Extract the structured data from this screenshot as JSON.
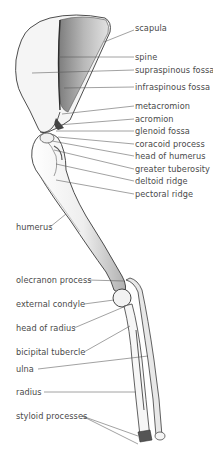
{
  "figure": {
    "colors": {
      "background": "#ffffff",
      "bone_fill": "#f4f4f4",
      "bone_shade": "#9a9a9a",
      "outline": "#3a3a3a",
      "leader": "#555555",
      "text": "#4a4a4a"
    },
    "labels_right": [
      {
        "text": "scapula",
        "x": 135,
        "y": 28
      },
      {
        "text": "spine",
        "x": 135,
        "y": 54
      },
      {
        "text": "supraspinous fossa",
        "x": 135,
        "y": 67
      },
      {
        "text": "infraspinous fossa",
        "x": 135,
        "y": 84
      },
      {
        "text": "metacromion",
        "x": 135,
        "y": 103
      },
      {
        "text": "acromion",
        "x": 135,
        "y": 116
      },
      {
        "text": "glenoid fossa",
        "x": 135,
        "y": 128
      },
      {
        "text": "coracoid process",
        "x": 135,
        "y": 141
      },
      {
        "text": "head of humerus",
        "x": 135,
        "y": 153
      },
      {
        "text": "greater tuberosity",
        "x": 135,
        "y": 166
      },
      {
        "text": "deltoid ridge",
        "x": 135,
        "y": 178
      },
      {
        "text": "pectoral ridge",
        "x": 135,
        "y": 191
      }
    ],
    "labels_left": [
      {
        "text": "humerus",
        "x": 16,
        "y": 224
      },
      {
        "text": "olecranon process",
        "x": 16,
        "y": 277
      },
      {
        "text": "external condyle",
        "x": 16,
        "y": 301
      },
      {
        "text": "head of radius",
        "x": 16,
        "y": 325
      },
      {
        "text": "bicipital tubercle",
        "x": 16,
        "y": 349
      },
      {
        "text": "ulna",
        "x": 16,
        "y": 366
      },
      {
        "text": "radius",
        "x": 16,
        "y": 389
      },
      {
        "text": "styloid processes",
        "x": 16,
        "y": 413
      }
    ]
  }
}
